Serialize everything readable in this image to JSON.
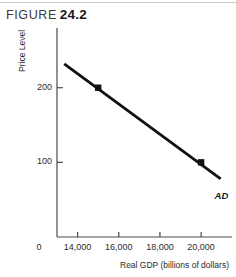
{
  "header": {
    "label": "FIGURE",
    "number": "24.2"
  },
  "chart_data": {
    "type": "line",
    "title": "",
    "xlabel": "Real GDP (billions of dollars)",
    "ylabel": "Price Level",
    "xlim": [
      13000,
      21500
    ],
    "ylim": [
      0,
      280
    ],
    "grid": false,
    "legend_position": "inline-right",
    "x_origin_label": "0",
    "xticks": [
      14000,
      16000,
      18000,
      20000
    ],
    "xtick_labels": [
      "14,000",
      "16,000",
      "18,000",
      "20,000"
    ],
    "yticks": [
      100,
      200
    ],
    "ytick_labels": [
      "100",
      "200"
    ],
    "series": [
      {
        "name": "AD",
        "label": "AD",
        "color": "#111111",
        "x": [
          13350,
          20950
        ],
        "y": [
          232,
          78
        ],
        "points": [
          {
            "x": 15000,
            "y": 200
          },
          {
            "x": 20000,
            "y": 100
          }
        ]
      }
    ],
    "annotations": [
      {
        "text": "AD",
        "x": 20800,
        "y": 55
      }
    ]
  }
}
